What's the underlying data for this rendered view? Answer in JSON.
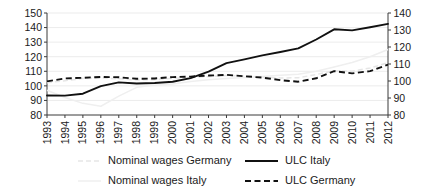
{
  "chart_data": {
    "type": "line",
    "title": "",
    "subtitle": "",
    "xlabel": "",
    "ylabel": "",
    "grid": true,
    "legend_position": "bottom",
    "x": [
      1993,
      1994,
      1995,
      1996,
      1997,
      1998,
      1999,
      2000,
      2001,
      2002,
      2003,
      2004,
      2005,
      2006,
      2007,
      2008,
      2009,
      2010,
      2011,
      2012
    ],
    "categories": [
      "1993",
      "1994",
      "1995",
      "1996",
      "1997",
      "1998",
      "1999",
      "2000",
      "2001",
      "2002",
      "2003",
      "2004",
      "2005",
      "2006",
      "2007",
      "2008",
      "2009",
      "2010",
      "2011",
      "2012"
    ],
    "ylim": [
      80,
      150
    ],
    "yticks": [
      80,
      90,
      100,
      110,
      120,
      130,
      140,
      150
    ],
    "ylim_right": [
      80,
      140
    ],
    "yticks_right": [
      80,
      90,
      100,
      110,
      120,
      130,
      140
    ],
    "series": [
      {
        "name": "ULC Italy",
        "axis": "left",
        "style": "solid",
        "color": "#111111",
        "values": [
          93.4,
          93.3,
          94.6,
          99.8,
          102.4,
          101.6,
          102.0,
          102.8,
          105.3,
          109.8,
          115.6,
          118.2,
          120.9,
          123.2,
          125.7,
          131.8,
          138.8,
          138.1,
          140.2,
          142.5
        ]
      },
      {
        "name": "ULC Germany",
        "axis": "right",
        "style": "dashed",
        "color": "#111111",
        "values": [
          99.8,
          101.5,
          101.9,
          102.4,
          102.2,
          101.3,
          101.5,
          102.3,
          102.6,
          103.2,
          103.6,
          102.8,
          102.0,
          100.5,
          99.6,
          101.6,
          105.8,
          104.5,
          105.8,
          109.6
        ]
      },
      {
        "name": "Nominal wages Germany",
        "axis": "right",
        "style": "light-dashed",
        "color": "#e6e6e6",
        "values": [
          99.0,
          100.2,
          101.4,
          101.8,
          101.3,
          100.6,
          100.8,
          101.6,
          102.0,
          102.6,
          103.2,
          102.9,
          102.4,
          101.8,
          101.9,
          103.8,
          106.0,
          105.8,
          107.6,
          110.8
        ]
      },
      {
        "name": "Nominal wages Italy",
        "axis": "left",
        "style": "light-solid",
        "color": "#efefef",
        "values": [
          97.0,
          92.0,
          88.0,
          86.0,
          93.0,
          99.0,
          100.5,
          101.2,
          103.0,
          104.2,
          105.0,
          105.8,
          106.5,
          107.2,
          108.0,
          110.0,
          113.0,
          116.0,
          120.0,
          125.0
        ]
      }
    ]
  },
  "legend": {
    "items": [
      {
        "label": "Nominal wages Germany",
        "style": "light-dashed"
      },
      {
        "label": "ULC Italy",
        "style": "solid"
      },
      {
        "label": "Nominal wages Italy",
        "style": "light-solid"
      },
      {
        "label": "ULC Germany",
        "style": "dashed"
      }
    ]
  }
}
